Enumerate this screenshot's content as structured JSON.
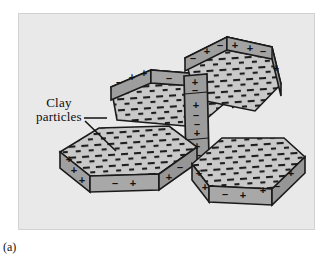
{
  "figure": {
    "caption": "(a)",
    "callout": {
      "line1": "Clay",
      "line2": "particles"
    },
    "colors": {
      "background": "#ffffff",
      "panel_fill": "#e9e9e9",
      "panel_border": "#d2d2d2",
      "plate_top_fill": "#c9c9c9",
      "plate_edge_fill": "#9e9e9e",
      "plate_edge_fill_dark": "#8f8f8f",
      "outline": "#1a1a1a",
      "charge_mark": "#161616",
      "text": "#0d0d0d"
    },
    "particles": [
      {
        "id": "particle-top-left",
        "orientation": "face-up-tilted",
        "face_charge": "negative",
        "face_mark": "–",
        "edges": [
          {
            "id": "edge-left",
            "signs": [
              "–",
              "+",
              "+"
            ]
          },
          {
            "id": "edge-right",
            "signs": [
              "–",
              "+",
              "+"
            ]
          }
        ]
      },
      {
        "id": "particle-top-right",
        "orientation": "face-up-tilted",
        "face_charge": "negative",
        "face_mark": "–",
        "edges": [
          {
            "id": "edge-left",
            "signs": [
              "–",
              "+",
              "–"
            ]
          },
          {
            "id": "edge-right",
            "signs": [
              "+",
              "+",
              "–",
              "+"
            ]
          }
        ]
      },
      {
        "id": "particle-center-vertical",
        "orientation": "edge-on",
        "face_charge": "negative",
        "face_mark": "–",
        "edges": [
          {
            "id": "edge-front",
            "signs": [
              "+",
              "–",
              "+",
              "–",
              "–",
              "+",
              "+",
              "+",
              "–"
            ]
          }
        ]
      },
      {
        "id": "particle-bottom-left",
        "orientation": "face-up",
        "face_charge": "negative",
        "face_mark": "–",
        "edges": [
          {
            "id": "edge-left",
            "signs": [
              "+",
              "+",
              "+"
            ]
          },
          {
            "id": "edge-front",
            "signs": [
              "–",
              "+"
            ]
          },
          {
            "id": "edge-right",
            "signs": [
              "+",
              "–"
            ]
          }
        ]
      },
      {
        "id": "particle-bottom-right",
        "orientation": "face-up",
        "face_charge": "negative",
        "face_mark": "–",
        "edges": [
          {
            "id": "edge-left",
            "signs": [
              "+",
              "+"
            ]
          },
          {
            "id": "edge-front",
            "signs": [
              "–",
              "+",
              "+",
              "–"
            ]
          }
        ]
      }
    ]
  }
}
